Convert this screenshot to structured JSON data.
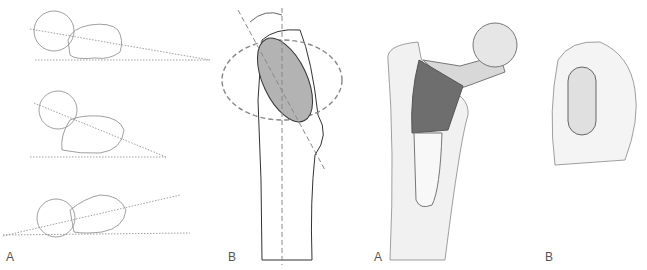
{
  "panels": [
    {
      "id": "panel-1",
      "label": "A",
      "description": "Femoral neck anteversion angle, three axial views"
    },
    {
      "id": "panel-2",
      "label": "B",
      "description": "Proximal femur with shaded neck ellipse and angle"
    },
    {
      "id": "panel-3",
      "label": "A",
      "description": "Hip prosthesis stem in femur"
    },
    {
      "id": "panel-4",
      "label": "B",
      "description": "Cross-section of stem in femur"
    }
  ],
  "colors": {
    "line": "#777777",
    "dash": "#8a8a8a",
    "shade": "#b3b3b3",
    "dark": "#6e6e6e",
    "bone": "#f1f1f1"
  }
}
